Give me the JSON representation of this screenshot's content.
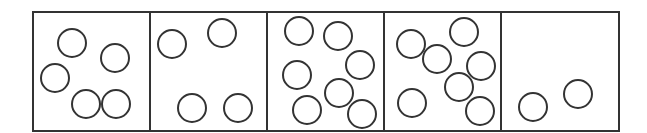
{
  "diagram": {
    "stroke_color": "#333333",
    "background": "#ffffff",
    "frame": {
      "x": 33,
      "y": 12,
      "width": 586,
      "height": 119,
      "stroke_width": 2
    },
    "circle_radius": 14,
    "circle_stroke_width": 2,
    "boxes": [
      {
        "index": 1,
        "x": 33,
        "width": 117,
        "circle_count": 5,
        "circles": [
          {
            "cx": 72,
            "cy": 43
          },
          {
            "cx": 115,
            "cy": 58
          },
          {
            "cx": 55,
            "cy": 78
          },
          {
            "cx": 86,
            "cy": 104
          },
          {
            "cx": 116,
            "cy": 104
          }
        ]
      },
      {
        "index": 2,
        "x": 150,
        "width": 117,
        "circle_count": 4,
        "circles": [
          {
            "cx": 172,
            "cy": 44
          },
          {
            "cx": 222,
            "cy": 33
          },
          {
            "cx": 192,
            "cy": 108
          },
          {
            "cx": 238,
            "cy": 108
          }
        ]
      },
      {
        "index": 3,
        "x": 267,
        "width": 117,
        "circle_count": 7,
        "circles": [
          {
            "cx": 299,
            "cy": 31
          },
          {
            "cx": 338,
            "cy": 36
          },
          {
            "cx": 360,
            "cy": 65
          },
          {
            "cx": 297,
            "cy": 75
          },
          {
            "cx": 339,
            "cy": 93
          },
          {
            "cx": 307,
            "cy": 110
          },
          {
            "cx": 362,
            "cy": 114
          }
        ]
      },
      {
        "index": 4,
        "x": 384,
        "width": 117,
        "circle_count": 7,
        "circles": [
          {
            "cx": 411,
            "cy": 44
          },
          {
            "cx": 437,
            "cy": 59
          },
          {
            "cx": 464,
            "cy": 32
          },
          {
            "cx": 481,
            "cy": 66
          },
          {
            "cx": 459,
            "cy": 87
          },
          {
            "cx": 412,
            "cy": 103
          },
          {
            "cx": 480,
            "cy": 111
          }
        ]
      },
      {
        "index": 5,
        "x": 501,
        "width": 118,
        "circle_count": 2,
        "circles": [
          {
            "cx": 533,
            "cy": 107
          },
          {
            "cx": 578,
            "cy": 94
          }
        ]
      }
    ]
  }
}
